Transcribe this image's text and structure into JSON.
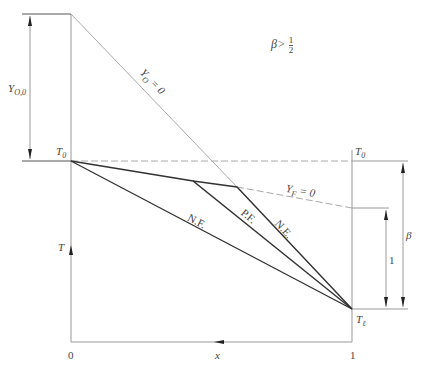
{
  "diagram": {
    "condition": {
      "beta": "β",
      "op": ">",
      "num": "1",
      "den": "2"
    },
    "labels": {
      "y_o0_main": "Y",
      "y_o0_sub": "O,0",
      "t0_left_main": "T",
      "t0_left_sub": "0",
      "t0_right_main": "T",
      "t0_right_sub": "0",
      "tl_main": "T",
      "tl_sub": "ℓ",
      "t_axis": "T",
      "x_axis": "x",
      "x_zero": "0",
      "x_one": "1",
      "yo_line_main": "Y",
      "yo_line_sub": "O",
      "yo_line_eq": "= 0",
      "yf_line_main": "Y",
      "yf_line_sub": "F",
      "yf_line_eq": "= 0",
      "nf_curve": "N.F.",
      "pf_curve": "P.F.",
      "ne_curve": "N.E.",
      "dim_one": "1",
      "dim_beta": "β"
    },
    "colors": {
      "line_dark": "#333333",
      "line_light": "#888888",
      "dashed": "#aaaaaa",
      "text": "#444444"
    }
  }
}
